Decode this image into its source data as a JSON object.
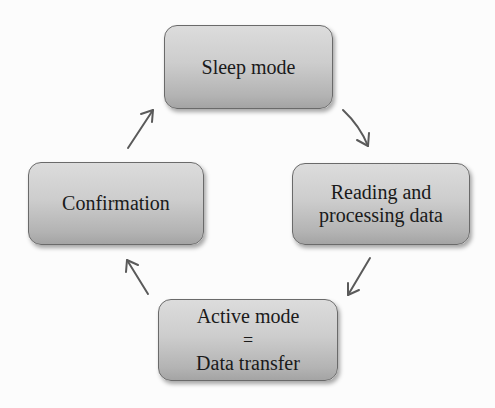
{
  "diagram": {
    "type": "cycle",
    "nodes": [
      {
        "id": "sleep",
        "label_lines": [
          "Sleep mode"
        ]
      },
      {
        "id": "reading",
        "label_lines": [
          "Reading and",
          "processing data"
        ]
      },
      {
        "id": "active",
        "label_lines": [
          "Active mode",
          "=",
          "Data transfer"
        ]
      },
      {
        "id": "confirm",
        "label_lines": [
          "Confirmation"
        ]
      }
    ],
    "edges": [
      {
        "from": "sleep",
        "to": "reading"
      },
      {
        "from": "reading",
        "to": "active"
      },
      {
        "from": "active",
        "to": "confirm"
      },
      {
        "from": "confirm",
        "to": "sleep"
      }
    ],
    "colors": {
      "box_top": "#dcdcdc",
      "box_bottom": "#a4a4a4",
      "box_border": "#6a6a6a",
      "arrow": "#5a5a5a",
      "text": "#1a1a1a"
    }
  }
}
